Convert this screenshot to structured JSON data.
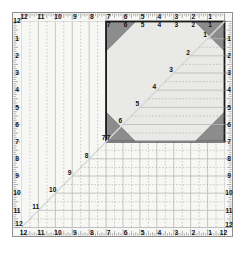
{
  "tool": {
    "name": "square-quilting-ruler",
    "title": "12 inch square quilting ruler",
    "size_inches": 12,
    "highlight_square_inches": 7
  },
  "colors": {
    "background": "#ffffff",
    "plate": "#f7f7f5",
    "frame_border": "#8f8f8f",
    "highlight_fill": "#e9e9e7",
    "highlight_border": "#1a1a1a",
    "corner_triangle": "#8c8c8c",
    "grid_line": "#b8b8b8",
    "dashed_line": "#9a9a9a",
    "diagonal_line": "#d8d8d8",
    "text": "#111111",
    "tick": "#555555"
  },
  "edges": {
    "top": {
      "name": "top-scale",
      "labels": [
        "12",
        "11",
        "10",
        "9",
        "8",
        "7",
        "6",
        "5",
        "4",
        "3",
        "2",
        "1"
      ],
      "direction": "left-to-right-descending"
    },
    "bottom": {
      "name": "bottom-scale",
      "corner_left": "12",
      "labels": [
        "11",
        "10",
        "9",
        "8",
        "7",
        "6",
        "5",
        "4",
        "3",
        "2",
        "1"
      ],
      "corner_right": "12",
      "direction": "left-to-right-descending"
    },
    "left": {
      "name": "left-scale",
      "corner_top": "12",
      "labels": [
        "1",
        "2",
        "3",
        "4",
        "5",
        "6",
        "7",
        "8",
        "9",
        "10",
        "11",
        "12"
      ],
      "direction": "top-to-bottom-ascending"
    },
    "right": {
      "name": "right-scale",
      "labels": [
        "1",
        "2",
        "3",
        "4",
        "5",
        "6",
        "7",
        "8",
        "9",
        "10",
        "11",
        "12"
      ],
      "corner_bottom": "12",
      "direction": "top-to-bottom-ascending"
    }
  },
  "diagonal": {
    "name": "45-degree-diagonal",
    "from": "bottom-left-corner",
    "to": "top-right-corner",
    "labels": [
      "1",
      "2",
      "3",
      "4",
      "5",
      "6",
      "7",
      "8",
      "9",
      "10",
      "11",
      "12"
    ]
  },
  "highlight_square": {
    "name": "seven-inch-square",
    "corner_labels": {
      "top_left": "7",
      "top_right": "1",
      "bottom_left": "7",
      "bottom_right": "7"
    },
    "top_labels": [
      "7",
      "6",
      "5",
      "4",
      "3",
      "2",
      "1"
    ],
    "corner_triangles": [
      "top-left",
      "top-right",
      "bottom-left",
      "bottom-right"
    ]
  },
  "chart_data": {
    "type": "table",
    "categories": [
      "1",
      "2",
      "3",
      "4",
      "5",
      "6",
      "7",
      "8",
      "9",
      "10",
      "11",
      "12"
    ],
    "values": [
      1,
      2,
      3,
      4,
      5,
      6,
      7,
      8,
      9,
      10,
      11,
      12
    ],
    "xlabel": "inches",
    "ylabel": "inches",
    "xlim": [
      0,
      12
    ],
    "ylim": [
      0,
      12
    ],
    "grid": true
  }
}
